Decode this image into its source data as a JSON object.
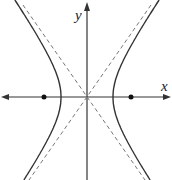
{
  "diagram": {
    "type": "hyperbola",
    "orientation": "horizontal-transverse-axis",
    "axes": {
      "x_label": "x",
      "y_label": "y"
    },
    "elements": {
      "center": {
        "x": 87,
        "y": 97
      },
      "vertices": [
        {
          "x": 61,
          "y": 97
        },
        {
          "x": 113,
          "y": 97
        }
      ],
      "foci": [
        {
          "x": 44,
          "y": 97
        },
        {
          "x": 131,
          "y": 97
        }
      ],
      "asymptotes": "dashed lines through center",
      "branches": [
        "left",
        "right"
      ]
    },
    "colors": {
      "curve": "#333333",
      "axes": "#333333",
      "asymptote": "#777777",
      "focus": "#111111",
      "background": "#ffffff"
    }
  }
}
